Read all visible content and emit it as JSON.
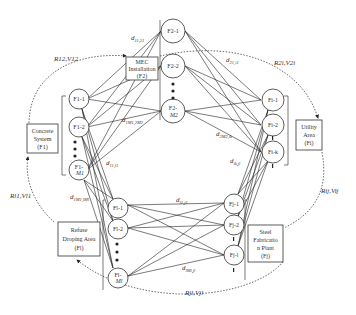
{
  "facilities": {
    "concrete": {
      "lines": [
        "Concrete",
        "System",
        "(F1)"
      ]
    },
    "mec": {
      "lines": [
        "MEC",
        "Installation",
        "(F2)"
      ]
    },
    "utility": {
      "lines": [
        "Utility",
        "Area",
        "(Fi)"
      ]
    },
    "refuse": {
      "lines": [
        "Refuse",
        "Droping Area",
        "(Fl)"
      ]
    },
    "steel": {
      "lines": [
        "Steel",
        "Fabricatio",
        "n Plant",
        "(Fj)"
      ]
    }
  },
  "nodes": {
    "f1": [
      {
        "label": "F1-1"
      },
      {
        "label": "F1-2"
      },
      {
        "label": "F1-",
        "label2": "M1"
      }
    ],
    "f2": [
      {
        "label": "F2-1"
      },
      {
        "label": "F2-2"
      },
      {
        "label": "F2-",
        "label2": "M2"
      }
    ],
    "fi": [
      {
        "label": "Fi-1"
      },
      {
        "label": "Fi-2"
      },
      {
        "label": "Fi-k"
      }
    ],
    "fl": [
      {
        "label": "Fl-1"
      },
      {
        "label": "Fl-2"
      },
      {
        "label": "Fl-",
        "label2": "Ml"
      }
    ],
    "fj": [
      {
        "label": "Fj-1"
      },
      {
        "label": "Fj-2"
      },
      {
        "label": "Fj-l"
      }
    ]
  },
  "distance_labels": {
    "d_11_21": {
      "main": "d",
      "sub": "11,21"
    },
    "d_21_i1": {
      "main": "d",
      "sub": "21,i1"
    },
    "d_1M1_2M2": {
      "main": "d",
      "sub": "1M1,2M2"
    },
    "d_2M2_ik": {
      "main": "d",
      "sub": "2M2,ik"
    },
    "d_11_l1": {
      "main": "d",
      "sub": "11,l1"
    },
    "d_ik_jl": {
      "main": "d",
      "sub": "ik,jl"
    },
    "d_1M1_lMl": {
      "main": "d",
      "sub": "1M1,lMl"
    },
    "d_l1_j1": {
      "main": "d",
      "sub": "l1,j1"
    },
    "d_lMl_jl": {
      "main": "d",
      "sub": "lMl,jl"
    }
  },
  "flow_labels": {
    "r12": {
      "text": "R12,V12"
    },
    "r2i": {
      "text": "R2i,V2i"
    },
    "rij": {
      "text": "Rij,Vij"
    },
    "rjl": {
      "text": "Rjl,Vjl"
    },
    "rl1": {
      "text": "Rl1,Vl1"
    }
  }
}
